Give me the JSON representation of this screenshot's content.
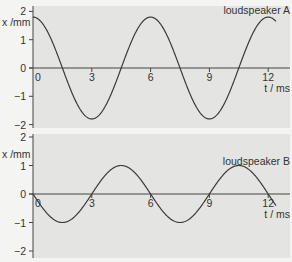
{
  "chart_data": [
    {
      "type": "line",
      "title": "loudspeaker A",
      "xlabel": "t / ms",
      "ylabel": "x /mm",
      "xlim": [
        0,
        12.4
      ],
      "ylim": [
        -2,
        2
      ],
      "x_ticks": [
        "0",
        "3",
        "6",
        "9",
        "12"
      ],
      "y_ticks": [
        "2",
        "1",
        "0",
        "−1",
        "−2"
      ],
      "grid": false,
      "series": [
        {
          "name": "loudspeaker A",
          "function": "1.8*cos(2*pi*t/6)",
          "x": [
            0,
            1.5,
            3,
            4.5,
            6,
            7.5,
            9,
            10.5,
            12
          ],
          "values": [
            1.8,
            0,
            -1.8,
            0,
            1.8,
            0,
            -1.8,
            0,
            1.8
          ]
        }
      ]
    },
    {
      "type": "line",
      "title": "loudspeaker B",
      "xlabel": "t / ms",
      "ylabel": "x /mm",
      "xlim": [
        0,
        12.4
      ],
      "ylim": [
        -2,
        2
      ],
      "x_ticks": [
        "0",
        "3",
        "6",
        "9",
        "12"
      ],
      "y_ticks": [
        "2",
        "1",
        "0",
        "−1",
        "−2"
      ],
      "grid": false,
      "series": [
        {
          "name": "loudspeaker B",
          "function": "-1.0*sin(2*pi*t/6)",
          "x": [
            0,
            1.5,
            3,
            4.5,
            6,
            7.5,
            9,
            10.5,
            12
          ],
          "values": [
            0,
            -1,
            0,
            1,
            0,
            -1,
            0,
            1,
            0
          ]
        }
      ]
    }
  ],
  "colors": {
    "plot_background": "#e4e4e2",
    "page_background": "#f4f4f2",
    "curve": "#3a3a3a",
    "axis": "#444444"
  }
}
